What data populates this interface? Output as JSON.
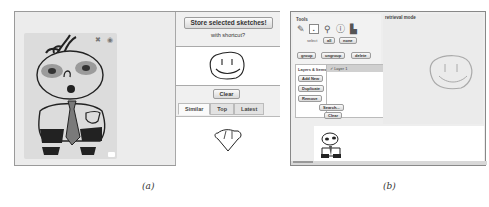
{
  "panel_a": {
    "sidebar": {
      "store_button": "Store selected sketches!",
      "shortcut_label": "with shortcut?",
      "clear_button": "Clear",
      "tabs": [
        {
          "label": "Similar",
          "active": true
        },
        {
          "label": "Top",
          "active": false
        },
        {
          "label": "Latest",
          "active": false
        }
      ]
    },
    "card_icons": [
      "close-icon",
      "settings-icon"
    ],
    "caption": "(a)"
  },
  "panel_b": {
    "tools_title": "Tools",
    "mode_label": "retrieval mode",
    "tool_icons": [
      "pen-icon",
      "select-icon",
      "magnifier-icon",
      "info-icon",
      "bucket-icon"
    ],
    "select_label": "select",
    "all_button": "all",
    "none_button": "none",
    "group_button": "group",
    "ungroup_button": "ungroup",
    "delete_button": "delete",
    "layers_label": "Layers & Items",
    "layer_buttons": [
      "Add New",
      "Duplicate",
      "Remove"
    ],
    "layer_items": [
      {
        "label": "Layer 1",
        "checked": true
      }
    ],
    "search_button": "Search...",
    "clear_button": "Clear",
    "caption": "(b)"
  }
}
